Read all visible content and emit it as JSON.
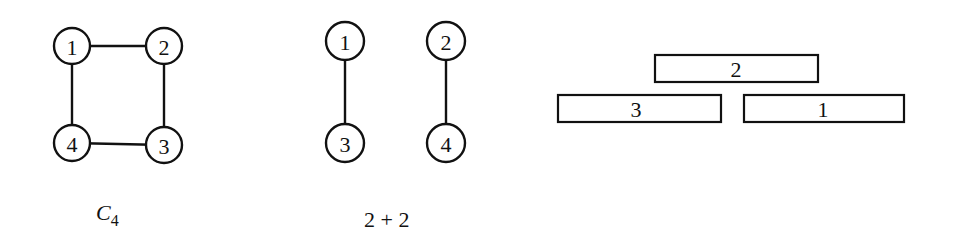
{
  "figures": [
    {
      "id": "c4",
      "caption_main": "C",
      "caption_sub": "4",
      "nodes": [
        {
          "label": "1",
          "x": 72,
          "y": 46
        },
        {
          "label": "2",
          "x": 164,
          "y": 46
        },
        {
          "label": "3",
          "x": 164,
          "y": 145
        },
        {
          "label": "4",
          "x": 72,
          "y": 143
        }
      ],
      "edges": [
        [
          "1",
          "2"
        ],
        [
          "2",
          "3"
        ],
        [
          "3",
          "4"
        ],
        [
          "4",
          "1"
        ]
      ]
    },
    {
      "id": "two-plus-two",
      "caption": "2 + 2",
      "nodes": [
        {
          "label": "1",
          "x": 345,
          "y": 41
        },
        {
          "label": "2",
          "x": 446,
          "y": 41
        },
        {
          "label": "3",
          "x": 345,
          "y": 143
        },
        {
          "label": "4",
          "x": 446,
          "y": 143
        }
      ],
      "edges": [
        [
          "1",
          "3"
        ],
        [
          "2",
          "4"
        ]
      ]
    },
    {
      "id": "interval-representation",
      "intervals": [
        {
          "label": "2",
          "x1": 655,
          "x2": 818,
          "y1": 55,
          "y2": 82
        },
        {
          "label": "3",
          "x1": 558,
          "x2": 721,
          "y1": 95,
          "y2": 122
        },
        {
          "label": "1",
          "x1": 744,
          "x2": 904,
          "y1": 95,
          "y2": 122
        }
      ]
    }
  ]
}
